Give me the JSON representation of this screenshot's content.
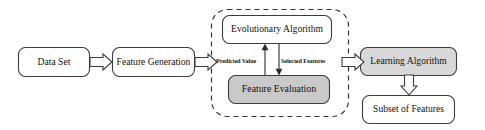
{
  "diagram": {
    "canvas": {
      "width": 485,
      "height": 130,
      "background": "#ffffff"
    },
    "colors": {
      "stroke": "#3c3c3c",
      "fill_plain": "#ffffff",
      "fill_shaded": "#c9c9c9",
      "fill_shaded_alt": "#d8d8d8",
      "text": "#111111",
      "dashed_border": "#333333"
    },
    "nodes": [
      {
        "id": "data-set",
        "label": "Data Set",
        "shape": "rounded-rectangle",
        "fill": "#ffffff",
        "x": 18,
        "y": 47,
        "w": 72,
        "h": 30
      },
      {
        "id": "feature-generation",
        "label": "Feature Generation",
        "shape": "rounded-rectangle",
        "fill": "#ffffff",
        "x": 112,
        "y": 47,
        "w": 83,
        "h": 30
      },
      {
        "id": "evolutionary-algorithm",
        "label": "Evolutionary Algorithm",
        "shape": "rounded-rectangle",
        "fill": "#ffffff",
        "x": 222,
        "y": 15,
        "w": 110,
        "h": 29
      },
      {
        "id": "feature-evaluation",
        "label": "Feature Evaluation",
        "shape": "rounded-rectangle",
        "fill": "#c9c9c9",
        "x": 228,
        "y": 75,
        "w": 102,
        "h": 29
      },
      {
        "id": "learning-algorithm",
        "label": "Learning Algorithm",
        "shape": "rounded-rectangle",
        "fill": "#d8d8d8",
        "x": 360,
        "y": 47,
        "w": 97,
        "h": 29
      },
      {
        "id": "subset-of-features",
        "label": "Subset of Features",
        "shape": "rounded-rectangle",
        "fill": "#ffffff",
        "x": 362,
        "y": 95,
        "w": 93,
        "h": 29
      }
    ],
    "groups": [
      {
        "id": "feature-selection-group",
        "label": "",
        "style": "dashed-rounded-rectangle",
        "x": 211,
        "y": 9,
        "w": 138,
        "h": 108
      }
    ],
    "edges": [
      {
        "id": "dataset-to-featuregen",
        "from": "data-set",
        "to": "feature-generation",
        "label": "",
        "style": "block-arrow",
        "direction": "right"
      },
      {
        "id": "featuregen-to-group",
        "from": "feature-generation",
        "to": "feature-selection-group",
        "label": "",
        "style": "block-arrow",
        "direction": "right"
      },
      {
        "id": "featureeval-to-evolutionary",
        "from": "feature-evaluation",
        "to": "evolutionary-algorithm",
        "label": "Predicted Value",
        "style": "line-arrow",
        "direction": "up"
      },
      {
        "id": "evolutionary-to-featureeval",
        "from": "evolutionary-algorithm",
        "to": "feature-evaluation",
        "label": "Selected Features",
        "style": "line-arrow",
        "direction": "down"
      },
      {
        "id": "group-to-learning",
        "from": "feature-selection-group",
        "to": "learning-algorithm",
        "label": "",
        "style": "block-arrow",
        "direction": "right"
      },
      {
        "id": "learning-to-subset",
        "from": "learning-algorithm",
        "to": "subset-of-features",
        "label": "",
        "style": "block-arrow",
        "direction": "down"
      }
    ],
    "edge_labels": {
      "predicted_value": "Predicted Value",
      "selected_features": "Selected Features"
    }
  }
}
